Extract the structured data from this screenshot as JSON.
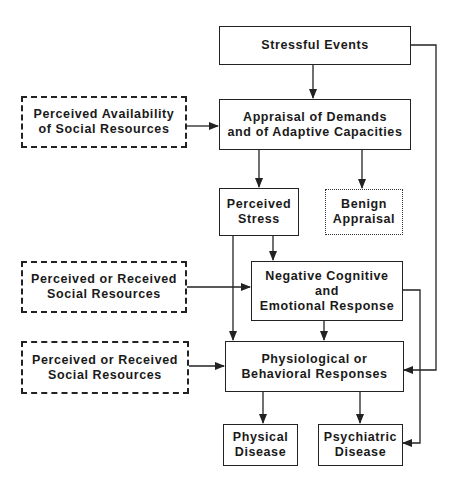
{
  "diagram": {
    "nodes": {
      "stressful_events": {
        "label": "Stressful Events"
      },
      "appraisal": {
        "label": "Appraisal of Demands\nand of Adaptive Capacities"
      },
      "perceived_availability": {
        "label": "Perceived Availability\nof Social Resources"
      },
      "perceived_stress": {
        "label": "Perceived\nStress"
      },
      "benign_appraisal": {
        "label": "Benign\nAppraisal"
      },
      "negative_response": {
        "label": "Negative Cognitive\nand\nEmotional Response"
      },
      "social_resources_1": {
        "label": "Perceived or Received\nSocial Resources"
      },
      "social_resources_2": {
        "label": "Perceived or Received\nSocial Resources"
      },
      "physiological": {
        "label": "Physiological or\nBehavioral Responses"
      },
      "physical_disease": {
        "label": "Physical\nDisease"
      },
      "psychiatric_disease": {
        "label": "Psychiatric\nDisease"
      }
    },
    "edges": [
      {
        "from": "stressful_events",
        "to": "appraisal"
      },
      {
        "from": "stressful_events",
        "to": "physiological"
      },
      {
        "from": "perceived_availability",
        "to": "appraisal"
      },
      {
        "from": "appraisal",
        "to": "perceived_stress"
      },
      {
        "from": "appraisal",
        "to": "benign_appraisal"
      },
      {
        "from": "perceived_stress",
        "to": "negative_response"
      },
      {
        "from": "perceived_stress",
        "to": "physiological"
      },
      {
        "from": "social_resources_1",
        "to": "negative_response"
      },
      {
        "from": "negative_response",
        "to": "physiological"
      },
      {
        "from": "negative_response",
        "to": "psychiatric_disease"
      },
      {
        "from": "social_resources_2",
        "to": "physiological"
      },
      {
        "from": "physiological",
        "to": "physical_disease"
      },
      {
        "from": "physiological",
        "to": "psychiatric_disease"
      }
    ],
    "styles": {
      "solid": [
        "stressful_events",
        "appraisal",
        "perceived_stress",
        "negative_response",
        "physiological",
        "physical_disease",
        "psychiatric_disease"
      ],
      "dashed": [
        "perceived_availability",
        "social_resources_1",
        "social_resources_2"
      ],
      "dotted": [
        "benign_appraisal"
      ]
    }
  }
}
